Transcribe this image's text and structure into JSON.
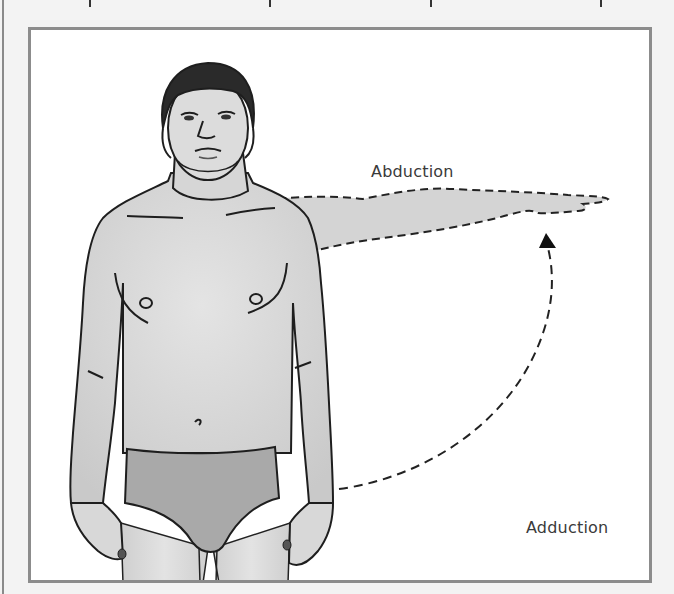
{
  "figure": {
    "labels": {
      "abduction": "Abduction",
      "adduction": "Adduction"
    },
    "motion": {
      "arrow_direction": "from-adduction-to-abduction",
      "arm_position": "abducted 90 degrees, dashed outline"
    },
    "colors": {
      "page_background": "#f3f3f3",
      "frame_border": "#8c8c8c",
      "frame_fill": "#ffffff",
      "skin": "#d9d9d9",
      "arm_ghost": "#d4d4d4",
      "underwear": "#a9a9a9",
      "hair": "#2a2a2a",
      "outline": "#1e1e1e",
      "label_text": "#3a3a3a"
    }
  }
}
